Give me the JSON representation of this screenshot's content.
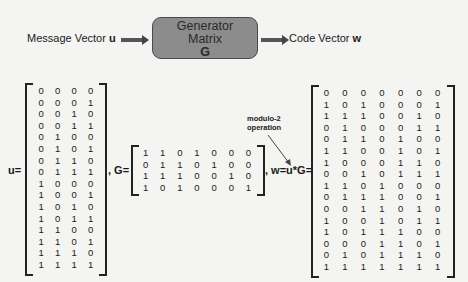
{
  "flow": {
    "input_label": "Message Vector ",
    "input_var": "u",
    "box_line1": "Generator",
    "box_line2": "Matrix",
    "box_line3": "G",
    "output_label": "Code Vector ",
    "output_var": "w"
  },
  "equations": {
    "u_label": "u=",
    "g_label": ", G=",
    "w_label": ", w=u*G="
  },
  "annotation": {
    "line1": "modulo-2",
    "line2": "operation"
  },
  "matrices": {
    "u": [
      [
        0,
        0,
        0,
        0
      ],
      [
        0,
        0,
        0,
        1
      ],
      [
        0,
        0,
        1,
        0
      ],
      [
        0,
        0,
        1,
        1
      ],
      [
        0,
        1,
        0,
        0
      ],
      [
        0,
        1,
        0,
        1
      ],
      [
        0,
        1,
        1,
        0
      ],
      [
        0,
        1,
        1,
        1
      ],
      [
        1,
        0,
        0,
        0
      ],
      [
        1,
        0,
        0,
        1
      ],
      [
        1,
        0,
        1,
        0
      ],
      [
        1,
        0,
        1,
        1
      ],
      [
        1,
        1,
        0,
        0
      ],
      [
        1,
        1,
        0,
        1
      ],
      [
        1,
        1,
        1,
        0
      ],
      [
        1,
        1,
        1,
        1
      ]
    ],
    "G": [
      [
        1,
        1,
        0,
        1,
        0,
        0,
        0
      ],
      [
        0,
        1,
        1,
        0,
        1,
        0,
        0
      ],
      [
        1,
        1,
        1,
        0,
        0,
        1,
        0
      ],
      [
        1,
        0,
        1,
        0,
        0,
        0,
        1
      ]
    ],
    "w": [
      [
        0,
        0,
        0,
        0,
        0,
        0,
        0
      ],
      [
        1,
        0,
        1,
        0,
        0,
        0,
        1
      ],
      [
        1,
        1,
        1,
        0,
        0,
        1,
        0
      ],
      [
        0,
        1,
        0,
        0,
        0,
        1,
        1
      ],
      [
        0,
        1,
        1,
        0,
        1,
        0,
        0
      ],
      [
        1,
        1,
        0,
        0,
        1,
        0,
        1
      ],
      [
        1,
        0,
        0,
        0,
        1,
        1,
        0
      ],
      [
        0,
        0,
        1,
        0,
        1,
        1,
        1
      ],
      [
        1,
        1,
        0,
        1,
        0,
        0,
        0
      ],
      [
        0,
        1,
        1,
        1,
        0,
        0,
        1
      ],
      [
        0,
        0,
        1,
        1,
        0,
        1,
        0
      ],
      [
        1,
        0,
        0,
        1,
        0,
        1,
        1
      ],
      [
        1,
        0,
        1,
        1,
        1,
        0,
        0
      ],
      [
        0,
        0,
        0,
        1,
        1,
        0,
        1
      ],
      [
        0,
        1,
        0,
        1,
        1,
        1,
        0
      ],
      [
        1,
        1,
        1,
        1,
        1,
        1,
        1
      ]
    ]
  }
}
